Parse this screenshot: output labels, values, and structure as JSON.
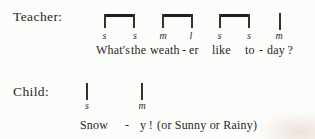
{
  "document": {
    "background": "#fcfcfa",
    "ink": "#2b2724",
    "beam_color": "#211e1b"
  },
  "teacher": {
    "label": "Teacher:",
    "solfa": [
      "s",
      "s",
      "m",
      "l",
      "s",
      "s",
      "m"
    ],
    "lyrics": [
      "What's",
      "the",
      "weath",
      "-",
      "er",
      "like",
      "to",
      "-",
      "day ?"
    ]
  },
  "child": {
    "label": "Child:",
    "solfa": [
      "s",
      "m"
    ],
    "lyrics": [
      "Snow",
      "-",
      "y !",
      "(or Sunny or Rainy)"
    ]
  }
}
